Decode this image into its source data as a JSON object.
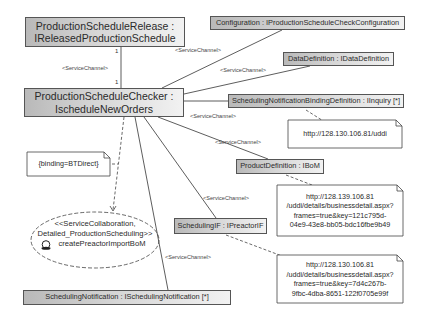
{
  "diagram": {
    "type": "UML service collaboration / composite structure",
    "components": {
      "release": {
        "line1": "ProductionScheduleRelease :",
        "line2": "IReleasedProductionSchedule"
      },
      "checker": {
        "line1": "ProductionScheduleChecker :",
        "line2": "IscheduleNewOrders"
      },
      "configuration": {
        "label": "Configuration : IProductionScheduleCheckConfiguration"
      },
      "data_definition": {
        "label": "DataDefinition : IDataDefinition"
      },
      "binding_definition": {
        "label": "SchedulingNotificationBindingDefinition : IInquiry [*]"
      },
      "product_definition": {
        "label": "ProductDefinition : IBoM"
      },
      "scheduling_if": {
        "label": "SchedulingIF : IPreactorIF"
      },
      "scheduling_notification": {
        "label": "SchedulingNotification : ISchedulingNotification [*]"
      }
    },
    "notes": {
      "binding": {
        "text": "{binding=BTDirect}"
      },
      "uddi": {
        "text": "http://128.130.106.81/uddi"
      },
      "bom_url": {
        "line1": "http://128.139.106.81",
        "line2": "/uddi/details/businessdetail.aspx?",
        "line3": "frames=true&key=121c795d-",
        "line4": "04e9-43e8-bb05-bdc16fbe9b49"
      },
      "preactor_url": {
        "line1": "http://128.130.106.81",
        "line2": "/uddi/details/businessdetail.aspx?",
        "line3": "frames=true&key=7d4c267b-",
        "line4": "9fbc-4dba-8651-122f0705e99f"
      }
    },
    "collaboration": {
      "line1": "<<ServiceCollaboration,",
      "line2": "Detailed_ProductionScheduling>>",
      "line3": "createPreactorImportBoM",
      "icon": "collaboration-icon"
    },
    "connectors": {
      "channel_label": "<ServiceChannel>",
      "labels": [
        "<ServiceChannel>",
        "<ServiceChannel>",
        "<ServiceChannel>",
        "<ServiceChannel>",
        "<ServiceChannel>",
        "<ServiceChannel>",
        "<ServiceChannel>"
      ],
      "multiplicity_top": "1",
      "multiplicity_bottom": "1"
    }
  }
}
